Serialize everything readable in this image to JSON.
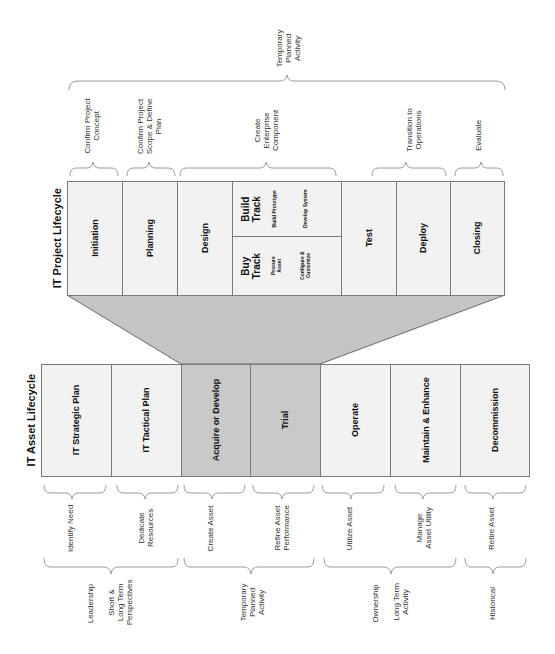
{
  "project_lifecycle": {
    "title": "IT Project Lifecycle",
    "top_group_label": "Temporary\nPlanned\nActivity",
    "phases": [
      {
        "name": "Initiation",
        "purpose": "Confirm Project\nConcept"
      },
      {
        "name": "Planning",
        "purpose": "Confirm Project\nScope & Define\nPlan"
      },
      {
        "name": "Design",
        "purpose": "Create\nEnterprise\nComponent"
      },
      {
        "name": "Test",
        "purpose": ""
      },
      {
        "name": "Deploy",
        "purpose": "Transition to\nOperations"
      },
      {
        "name": "Closing",
        "purpose": "Evaluate"
      }
    ],
    "build_track": {
      "label": "Build\nTrack",
      "steps": [
        "Build Prototype",
        "Develop System"
      ]
    },
    "buy_track": {
      "label": "Buy\nTrack",
      "steps": [
        "Procure\nAsset",
        "Configure &\nCustomize"
      ]
    }
  },
  "asset_lifecycle": {
    "title": "IT Asset Lifecycle",
    "phases": [
      {
        "name": "IT Strategic Plan",
        "purpose": "Identify Need"
      },
      {
        "name": "IT Tactical Plan",
        "purpose": "Dedicate\nResources"
      },
      {
        "name": "Acquire or Develop",
        "purpose": "Create Asset"
      },
      {
        "name": "Trial",
        "purpose": "Refine Asset\nPerformance"
      },
      {
        "name": "Operate",
        "purpose": "Utilize Asset"
      },
      {
        "name": "Maintain & Enhance",
        "purpose": "Manage\nAsset Utility"
      },
      {
        "name": "Decommission",
        "purpose": "Retire Asset"
      }
    ],
    "groups": [
      {
        "label": "Leadership",
        "sublabel": "Short &\nLong Term\nPerspectives"
      },
      {
        "label": "Temporary\nPlanned\nActivity",
        "sublabel": ""
      },
      {
        "label": "Ownership",
        "sublabel": "Long Term\nActivity"
      },
      {
        "label": "Historical",
        "sublabel": ""
      }
    ]
  },
  "colors": {
    "box_fill": "#f2f2f2",
    "highlight_fill": "#c9c9c9",
    "connector_fill": "#c4c4c4",
    "border": "#7a7a7a",
    "brace": "#9a9a9a"
  }
}
